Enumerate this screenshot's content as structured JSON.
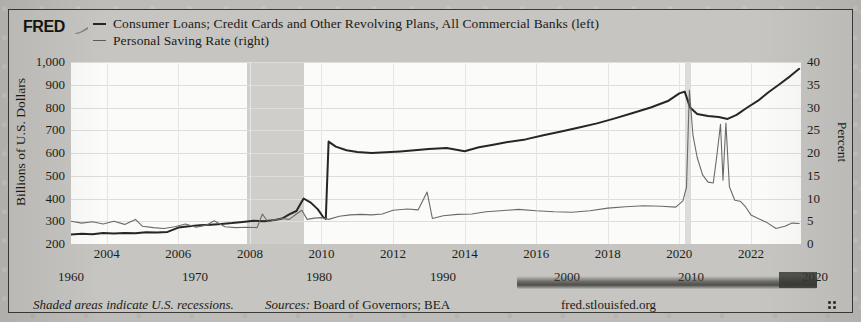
{
  "branding": {
    "logo": "FRED",
    "logo_mark": "fred-swoosh-icon"
  },
  "legend": {
    "series": [
      {
        "label": "Consumer Loans; Credit Cards and Other Revolving Plans, All Commercial Banks (left)",
        "axis": "left",
        "color": "#262622"
      },
      {
        "label": "Personal Saving Rate (right)",
        "axis": "right",
        "color": "#6b6b66"
      }
    ]
  },
  "footer": {
    "note": "Shaded areas indicate U.S. recessions.",
    "sources_label": "Sources:",
    "sources_value": "Board of Governors; BEA",
    "url": "fred.stlouisfed.org",
    "resize_handle": "resize-handle-dots-icon"
  },
  "axes": {
    "left": {
      "title": "Billions of U.S. Dollars",
      "ticks": [
        "200",
        "300",
        "400",
        "500",
        "600",
        "700",
        "800",
        "900",
        "1,000"
      ],
      "min": 200,
      "max": 1000
    },
    "right": {
      "title": "Percent",
      "ticks": [
        "0",
        "5",
        "10",
        "15",
        "20",
        "25",
        "30",
        "35",
        "40"
      ],
      "min": 0,
      "max": 40
    },
    "x_primary": {
      "ticks": [
        "2004",
        "2006",
        "2008",
        "2010",
        "2012",
        "2014",
        "2016",
        "2018",
        "2020",
        "2022"
      ]
    },
    "x_secondary": {
      "ticks": [
        "1960",
        "1970",
        "1980",
        "1990",
        "2000",
        "2010",
        "2020"
      ]
    }
  },
  "chart_data": {
    "type": "line",
    "xlabel": "",
    "ylabel": "Billions of U.S. Dollars",
    "y2label": "Percent",
    "ylim": [
      200,
      1000
    ],
    "y2lim": [
      0,
      40
    ],
    "xlim": [
      2003.0,
      2023.4
    ],
    "grid": true,
    "legend_position": "top",
    "recession_bands": [
      {
        "start": 2007.92,
        "end": 2009.5
      },
      {
        "start": 2020.15,
        "end": 2020.33
      }
    ],
    "series": [
      {
        "name": "Consumer Loans; Credit Cards and Other Revolving Plans, All Commercial Banks (left)",
        "axis": "left",
        "units": "Billions of U.S. Dollars",
        "color": "#262622",
        "points": [
          [
            2003.0,
            242
          ],
          [
            2003.3,
            245
          ],
          [
            2003.6,
            243
          ],
          [
            2003.9,
            248
          ],
          [
            2004.2,
            246
          ],
          [
            2004.5,
            249
          ],
          [
            2004.8,
            247
          ],
          [
            2005.1,
            252
          ],
          [
            2005.4,
            250
          ],
          [
            2005.7,
            253
          ],
          [
            2006.0,
            272
          ],
          [
            2006.3,
            278
          ],
          [
            2006.6,
            282
          ],
          [
            2006.9,
            285
          ],
          [
            2007.2,
            288
          ],
          [
            2007.5,
            292
          ],
          [
            2007.8,
            297
          ],
          [
            2008.1,
            302
          ],
          [
            2008.4,
            300
          ],
          [
            2008.7,
            305
          ],
          [
            2008.9,
            312
          ],
          [
            2009.1,
            330
          ],
          [
            2009.3,
            345
          ],
          [
            2009.5,
            400
          ],
          [
            2009.7,
            382
          ],
          [
            2009.9,
            352
          ],
          [
            2010.05,
            318
          ],
          [
            2010.12,
            310
          ],
          [
            2010.2,
            650
          ],
          [
            2010.4,
            628
          ],
          [
            2010.7,
            612
          ],
          [
            2011.0,
            605
          ],
          [
            2011.4,
            600
          ],
          [
            2011.8,
            603
          ],
          [
            2012.2,
            607
          ],
          [
            2012.6,
            612
          ],
          [
            2013.0,
            618
          ],
          [
            2013.5,
            622
          ],
          [
            2014.0,
            608
          ],
          [
            2014.4,
            625
          ],
          [
            2014.8,
            636
          ],
          [
            2015.2,
            648
          ],
          [
            2015.7,
            660
          ],
          [
            2016.2,
            678
          ],
          [
            2016.7,
            694
          ],
          [
            2017.2,
            712
          ],
          [
            2017.7,
            730
          ],
          [
            2018.2,
            752
          ],
          [
            2018.7,
            776
          ],
          [
            2019.2,
            800
          ],
          [
            2019.7,
            830
          ],
          [
            2020.0,
            862
          ],
          [
            2020.15,
            870
          ],
          [
            2020.3,
            800
          ],
          [
            2020.5,
            772
          ],
          [
            2020.8,
            762
          ],
          [
            2021.1,
            758
          ],
          [
            2021.35,
            750
          ],
          [
            2021.6,
            768
          ],
          [
            2021.9,
            800
          ],
          [
            2022.2,
            830
          ],
          [
            2022.5,
            868
          ],
          [
            2022.8,
            902
          ],
          [
            2023.1,
            938
          ],
          [
            2023.35,
            970
          ]
        ]
      },
      {
        "name": "Personal Saving Rate (right)",
        "axis": "right",
        "units": "Percent",
        "color": "#6b6b66",
        "points": [
          [
            2003.0,
            5.0
          ],
          [
            2003.3,
            4.6
          ],
          [
            2003.6,
            4.9
          ],
          [
            2003.9,
            4.4
          ],
          [
            2004.2,
            5.0
          ],
          [
            2004.5,
            4.3
          ],
          [
            2004.8,
            5.4
          ],
          [
            2005.0,
            3.9
          ],
          [
            2005.3,
            3.6
          ],
          [
            2005.6,
            3.4
          ],
          [
            2005.9,
            3.8
          ],
          [
            2006.2,
            4.4
          ],
          [
            2006.5,
            3.7
          ],
          [
            2006.8,
            4.2
          ],
          [
            2007.0,
            5.1
          ],
          [
            2007.3,
            3.8
          ],
          [
            2007.6,
            3.6
          ],
          [
            2007.9,
            3.7
          ],
          [
            2008.2,
            3.6
          ],
          [
            2008.35,
            6.6
          ],
          [
            2008.5,
            4.9
          ],
          [
            2008.7,
            5.3
          ],
          [
            2008.9,
            5.6
          ],
          [
            2009.1,
            5.4
          ],
          [
            2009.3,
            6.6
          ],
          [
            2009.45,
            7.4
          ],
          [
            2009.6,
            5.4
          ],
          [
            2009.8,
            5.7
          ],
          [
            2010.0,
            5.8
          ],
          [
            2010.2,
            5.4
          ],
          [
            2010.5,
            6.1
          ],
          [
            2010.8,
            6.4
          ],
          [
            2011.1,
            6.5
          ],
          [
            2011.4,
            6.4
          ],
          [
            2011.7,
            6.6
          ],
          [
            2012.0,
            7.4
          ],
          [
            2012.4,
            7.7
          ],
          [
            2012.7,
            7.5
          ],
          [
            2012.95,
            11.4
          ],
          [
            2013.1,
            5.6
          ],
          [
            2013.4,
            6.2
          ],
          [
            2013.8,
            6.5
          ],
          [
            2014.2,
            6.6
          ],
          [
            2014.6,
            7.1
          ],
          [
            2015.0,
            7.3
          ],
          [
            2015.5,
            7.6
          ],
          [
            2016.0,
            7.3
          ],
          [
            2016.5,
            7.1
          ],
          [
            2017.0,
            7.0
          ],
          [
            2017.5,
            7.3
          ],
          [
            2018.0,
            7.9
          ],
          [
            2018.5,
            8.2
          ],
          [
            2019.0,
            8.4
          ],
          [
            2019.5,
            8.3
          ],
          [
            2019.9,
            8.1
          ],
          [
            2020.1,
            9.5
          ],
          [
            2020.2,
            12.5
          ],
          [
            2020.28,
            33.8
          ],
          [
            2020.38,
            24.0
          ],
          [
            2020.5,
            19.0
          ],
          [
            2020.65,
            15.2
          ],
          [
            2020.8,
            13.6
          ],
          [
            2020.95,
            13.4
          ],
          [
            2021.05,
            19.5
          ],
          [
            2021.15,
            26.3
          ],
          [
            2021.22,
            14.0
          ],
          [
            2021.3,
            26.6
          ],
          [
            2021.4,
            12.6
          ],
          [
            2021.55,
            9.6
          ],
          [
            2021.7,
            9.4
          ],
          [
            2021.85,
            8.2
          ],
          [
            2022.0,
            6.4
          ],
          [
            2022.2,
            5.6
          ],
          [
            2022.45,
            4.7
          ],
          [
            2022.7,
            3.4
          ],
          [
            2022.95,
            3.9
          ],
          [
            2023.15,
            4.6
          ],
          [
            2023.35,
            4.5
          ]
        ]
      }
    ]
  }
}
